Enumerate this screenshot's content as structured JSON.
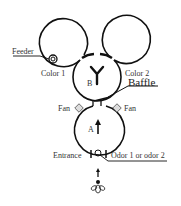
{
  "diagram": {
    "chambers": [
      {
        "id": "color1",
        "label": "Color 1"
      },
      {
        "id": "color2",
        "label": "Color 2"
      },
      {
        "id": "B",
        "label": "B"
      },
      {
        "id": "A",
        "label": "A"
      }
    ],
    "labels": {
      "feeder": "Feeder",
      "color1": "Color 1",
      "color2": "Color 2",
      "baffle": "Baffle",
      "fan_left": "Fan",
      "fan_right": "Fan",
      "chamber_b": "B",
      "chamber_a": "A",
      "entrance": "Entrance",
      "odor": "Odor 1 or odor 2"
    },
    "colors": {
      "stroke": "#111111",
      "text": "#333333",
      "fan_fill": "#dddddd"
    }
  }
}
